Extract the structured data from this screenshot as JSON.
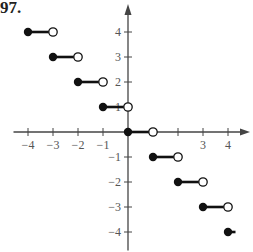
{
  "problem_number": "97.",
  "chart_data": {
    "type": "line",
    "title": "",
    "xlabel": "",
    "ylabel": "",
    "xlim": [
      -4.5,
      4.9
    ],
    "ylim": [
      -4.5,
      4.9
    ],
    "grid": false,
    "x_ticks": [
      -4,
      -3,
      -2,
      -1,
      1,
      2,
      3,
      4
    ],
    "x_tick_labels": [
      "-4",
      "-3",
      "-2",
      "-1",
      "3",
      "4"
    ],
    "y_ticks": [
      -4,
      -3,
      -2,
      -1,
      1,
      2,
      3,
      4
    ],
    "y_tick_labels": [
      "4",
      "3",
      "2",
      "1",
      "-1",
      "-2",
      "-3",
      "-4"
    ],
    "segments": [
      {
        "x_start": -4,
        "x_end": -3,
        "y": 4,
        "closed_start": true,
        "closed_end": false
      },
      {
        "x_start": -3,
        "x_end": -2,
        "y": 3,
        "closed_start": true,
        "closed_end": false
      },
      {
        "x_start": -2,
        "x_end": -1,
        "y": 2,
        "closed_start": true,
        "closed_end": false
      },
      {
        "x_start": -1,
        "x_end": 0,
        "y": 1,
        "closed_start": true,
        "closed_end": false
      },
      {
        "x_start": 0,
        "x_end": 1,
        "y": 0,
        "closed_start": true,
        "closed_end": false
      },
      {
        "x_start": 1,
        "x_end": 2,
        "y": -1,
        "closed_start": true,
        "closed_end": false
      },
      {
        "x_start": 2,
        "x_end": 3,
        "y": -2,
        "closed_start": true,
        "closed_end": false
      },
      {
        "x_start": 3,
        "x_end": 4,
        "y": -3,
        "closed_start": true,
        "closed_end": false
      },
      {
        "x_start": 4,
        "x_end": 4.3,
        "y": -4,
        "closed_start": true,
        "closed_end": null
      }
    ]
  },
  "axes": {
    "origin_px": [
      128,
      132
    ],
    "unit_px": 25
  }
}
